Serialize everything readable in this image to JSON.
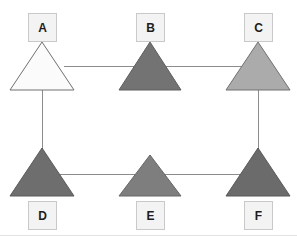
{
  "diagram": {
    "canvas": {
      "width": 297,
      "height": 236,
      "background": "#ffffff",
      "border_color": "#e2e2e2"
    },
    "node_shape": "triangle",
    "label_box": {
      "fill": "#f3f3f3",
      "border": "#c9c9c9",
      "text_color": "#1c1c1c",
      "size": 29
    },
    "edge_color": "#8c8c8c",
    "edge_width": 1,
    "nodes": [
      {
        "id": "A",
        "label": "A",
        "fill": "#fbfbfb",
        "stroke": "#707070",
        "label_position": "above",
        "apex": {
          "x": 42,
          "y": 42
        },
        "base_left": {
          "x": 10,
          "y": 90
        },
        "base_right": {
          "x": 74,
          "y": 90
        },
        "label_box": {
          "x": 28,
          "y": 13
        }
      },
      {
        "id": "B",
        "label": "B",
        "fill": "#737373",
        "stroke": "#5e5e5e",
        "label_position": "above",
        "apex": {
          "x": 150,
          "y": 42
        },
        "base_left": {
          "x": 119,
          "y": 90
        },
        "base_right": {
          "x": 181,
          "y": 90
        },
        "label_box": {
          "x": 136,
          "y": 13
        }
      },
      {
        "id": "C",
        "label": "C",
        "fill": "#ababab",
        "stroke": "#707070",
        "label_position": "above",
        "apex": {
          "x": 258,
          "y": 42
        },
        "base_left": {
          "x": 226,
          "y": 90
        },
        "base_right": {
          "x": 290,
          "y": 90
        },
        "label_box": {
          "x": 244,
          "y": 13
        }
      },
      {
        "id": "D",
        "label": "D",
        "fill": "#6e6e6e",
        "stroke": "#5a5a5a",
        "label_position": "below",
        "apex": {
          "x": 42,
          "y": 148
        },
        "base_left": {
          "x": 10,
          "y": 196
        },
        "base_right": {
          "x": 74,
          "y": 196
        },
        "label_box": {
          "x": 28,
          "y": 201
        }
      },
      {
        "id": "E",
        "label": "E",
        "fill": "#7e7e7e",
        "stroke": "#676767",
        "label_position": "below",
        "apex": {
          "x": 150,
          "y": 155
        },
        "base_left": {
          "x": 119,
          "y": 196
        },
        "base_right": {
          "x": 181,
          "y": 196
        },
        "label_box": {
          "x": 136,
          "y": 201
        }
      },
      {
        "id": "F",
        "label": "F",
        "fill": "#6b6b6b",
        "stroke": "#585858",
        "label_position": "below",
        "apex": {
          "x": 258,
          "y": 148
        },
        "base_left": {
          "x": 226,
          "y": 196
        },
        "base_right": {
          "x": 290,
          "y": 196
        },
        "label_box": {
          "x": 244,
          "y": 201
        }
      }
    ],
    "edges": [
      {
        "id": "A-B",
        "from": "A",
        "to": "B",
        "orientation": "horizontal",
        "x1": 64,
        "y1": 66,
        "x2": 135,
        "y2": 66
      },
      {
        "id": "B-C",
        "from": "B",
        "to": "C",
        "orientation": "horizontal",
        "x1": 166,
        "y1": 66,
        "x2": 243,
        "y2": 66
      },
      {
        "id": "D-E",
        "from": "D",
        "to": "E",
        "orientation": "horizontal",
        "x1": 58,
        "y1": 174,
        "x2": 137,
        "y2": 174
      },
      {
        "id": "E-F",
        "from": "E",
        "to": "F",
        "orientation": "horizontal",
        "x1": 164,
        "y1": 174,
        "x2": 242,
        "y2": 174
      },
      {
        "id": "A-D",
        "from": "A",
        "to": "D",
        "orientation": "vertical",
        "x1": 42,
        "y1": 90,
        "x2": 42,
        "y2": 150
      },
      {
        "id": "C-F",
        "from": "C",
        "to": "F",
        "orientation": "vertical",
        "x1": 258,
        "y1": 90,
        "x2": 258,
        "y2": 150
      }
    ]
  }
}
